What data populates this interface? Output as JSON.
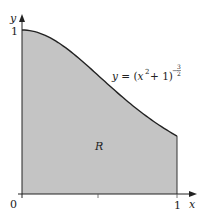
{
  "figure": {
    "function_label": {
      "prefix": "y = (x",
      "sq": "2",
      "mid": " + 1)",
      "exp_sign": "−",
      "exp_num": "3",
      "exp_den": "2"
    },
    "region_label": "R",
    "axes": {
      "x_label": "x",
      "y_label": "y",
      "origin_label": "0",
      "x_tick_label": "1",
      "y_tick_label": "1"
    },
    "colors": {
      "fill": "#c4c4c4",
      "stroke": "#222222"
    }
  }
}
